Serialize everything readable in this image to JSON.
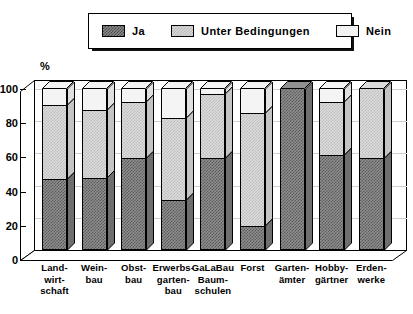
{
  "legend": {
    "items": [
      {
        "label": "Ja",
        "swatch": "ja-swatch",
        "color": "#595959"
      },
      {
        "label": "Unter Bedingungen",
        "swatch": "unter-bedingungen-swatch",
        "color": "#bdbdbd"
      },
      {
        "label": "Nein",
        "swatch": "nein-swatch",
        "color": "#f4f4f4"
      }
    ]
  },
  "axis": {
    "y_unit": "%",
    "y_ticks": [
      "0",
      "20",
      "40",
      "60",
      "80",
      "100"
    ]
  },
  "chart_data": {
    "type": "bar",
    "title": "",
    "xlabel": "",
    "ylabel": "%",
    "ylim": [
      0,
      100
    ],
    "grid": true,
    "stacked": true,
    "legend_position": "top",
    "categories": [
      "Land-\nwirt-\nschaft",
      "Wein-\nbau",
      "Obst-\nbau",
      "Erwerbs-\ngarten-\nbau",
      "GaLaBau\nBaum-\nschulen",
      "Forst",
      "Garten-\nämter",
      "Hobby-\ngärtner",
      "Erden-\nwerke"
    ],
    "categories_flat": [
      "Landwirtschaft",
      "Weinbau",
      "Obstbau",
      "Erwerbsgartenbau",
      "GaLaBau Baumschulen",
      "Forst",
      "Gartenämter",
      "Hobbygärtner",
      "Erdenwerke"
    ],
    "series": [
      {
        "name": "Ja",
        "values": [
          44,
          45,
          57,
          31,
          57,
          15,
          100,
          59,
          57
        ]
      },
      {
        "name": "Unter Bedingungen",
        "values": [
          46,
          42,
          35,
          51,
          40,
          70,
          0,
          33,
          43
        ]
      },
      {
        "name": "Nein",
        "values": [
          10,
          13,
          8,
          18,
          3,
          15,
          0,
          8,
          0
        ]
      }
    ]
  }
}
